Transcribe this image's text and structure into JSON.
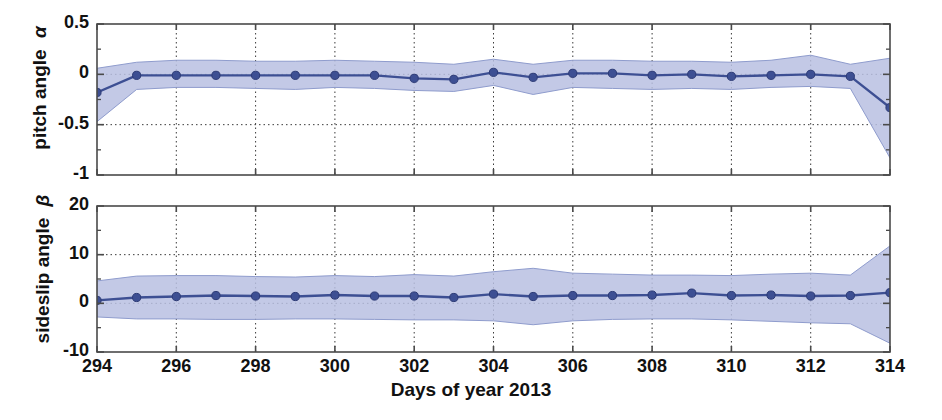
{
  "chart_data": [
    {
      "type": "line",
      "panel": "top",
      "title": "",
      "xlabel": "",
      "ylabel": "pitch angle α",
      "ylabel_text": "pitch angle",
      "ylabel_symbol": "α",
      "xlim": [
        294,
        314
      ],
      "ylim": [
        -1,
        0.5
      ],
      "yticks": [
        0.5,
        0,
        -0.5,
        -1
      ],
      "ytick_labels": [
        "0.5",
        "0",
        "-0.5",
        "-1"
      ],
      "yminorticks": [
        0.25,
        -0.25,
        -0.75
      ],
      "xticks": [
        294,
        296,
        298,
        300,
        302,
        304,
        306,
        308,
        310,
        312,
        314
      ],
      "grid": "dotted",
      "legend": "none",
      "series": [
        {
          "name": "mean pitch angle",
          "marker": "circle",
          "color": "#3d4f93",
          "x": [
            294,
            295,
            296,
            297,
            298,
            299,
            300,
            301,
            302,
            303,
            304,
            305,
            306,
            307,
            308,
            309,
            310,
            311,
            312,
            313,
            314
          ],
          "values": [
            -0.18,
            -0.01,
            -0.01,
            -0.01,
            -0.01,
            -0.01,
            -0.01,
            -0.01,
            -0.04,
            -0.05,
            0.02,
            -0.03,
            0.01,
            0.01,
            -0.01,
            0.0,
            -0.02,
            -0.01,
            0.0,
            -0.02,
            -0.33
          ]
        }
      ],
      "band": {
        "name": "uncertainty band",
        "color": "#b9c0e2",
        "x": [
          294,
          295,
          296,
          297,
          298,
          299,
          300,
          301,
          302,
          303,
          304,
          305,
          306,
          307,
          308,
          309,
          310,
          311,
          312,
          313,
          314
        ],
        "upper": [
          0.06,
          0.12,
          0.14,
          0.14,
          0.13,
          0.13,
          0.14,
          0.13,
          0.12,
          0.1,
          0.15,
          0.1,
          0.14,
          0.14,
          0.13,
          0.13,
          0.12,
          0.14,
          0.19,
          0.1,
          0.16
        ],
        "lower": [
          -0.47,
          -0.15,
          -0.13,
          -0.13,
          -0.14,
          -0.15,
          -0.13,
          -0.14,
          -0.16,
          -0.17,
          -0.11,
          -0.2,
          -0.13,
          -0.14,
          -0.15,
          -0.14,
          -0.15,
          -0.13,
          -0.12,
          -0.14,
          -0.83
        ]
      }
    },
    {
      "type": "line",
      "panel": "bottom",
      "title": "",
      "xlabel": "Days of year 2013",
      "ylabel": "sideslip angle β",
      "ylabel_text": "sideslip angle",
      "ylabel_symbol": "β",
      "xlim": [
        294,
        314
      ],
      "ylim": [
        -10,
        20
      ],
      "yticks": [
        20,
        10,
        0,
        -10
      ],
      "ytick_labels": [
        "20",
        "10",
        "0",
        "-10"
      ],
      "yminorticks": [
        15,
        5,
        -5
      ],
      "xticks": [
        294,
        296,
        298,
        300,
        302,
        304,
        306,
        308,
        310,
        312,
        314
      ],
      "grid": "dotted",
      "legend": "none",
      "series": [
        {
          "name": "mean sideslip angle",
          "marker": "circle",
          "color": "#3d4f93",
          "x": [
            294,
            295,
            296,
            297,
            298,
            299,
            300,
            301,
            302,
            303,
            304,
            305,
            306,
            307,
            308,
            309,
            310,
            311,
            312,
            313,
            314
          ],
          "values": [
            0.6,
            1.2,
            1.4,
            1.6,
            1.5,
            1.4,
            1.7,
            1.5,
            1.5,
            1.2,
            1.9,
            1.4,
            1.6,
            1.6,
            1.7,
            2.1,
            1.6,
            1.7,
            1.5,
            1.6,
            2.2
          ]
        }
      ],
      "band": {
        "name": "uncertainty band",
        "color": "#b9c0e2",
        "x": [
          294,
          295,
          296,
          297,
          298,
          299,
          300,
          301,
          302,
          303,
          304,
          305,
          306,
          307,
          308,
          309,
          310,
          311,
          312,
          313,
          314
        ],
        "upper": [
          4.6,
          5.6,
          5.7,
          5.7,
          5.5,
          5.4,
          5.7,
          5.5,
          5.9,
          5.6,
          6.5,
          7.2,
          6.2,
          6.0,
          5.8,
          5.8,
          5.7,
          6.0,
          6.2,
          5.8,
          11.8
        ],
        "lower": [
          -2.8,
          -3.2,
          -3.2,
          -3.3,
          -3.3,
          -3.2,
          -3.2,
          -3.3,
          -3.4,
          -3.4,
          -3.6,
          -4.4,
          -3.6,
          -3.3,
          -3.2,
          -3.2,
          -3.4,
          -3.7,
          -4.0,
          -4.2,
          -8.2
        ]
      }
    }
  ],
  "axes": {
    "top": {
      "ylabel_text": "pitch angle",
      "ylabel_symbol": "α",
      "ytick_labels": [
        "0.5",
        "0",
        "-0.5",
        "-1"
      ]
    },
    "bottom": {
      "ylabel_text": "sideslip angle",
      "ylabel_symbol": "β",
      "ytick_labels": [
        "20",
        "10",
        "0",
        "-10"
      ]
    },
    "xtick_labels": [
      "294",
      "296",
      "298",
      "300",
      "302",
      "304",
      "306",
      "308",
      "310",
      "312",
      "314"
    ],
    "xlabel": "Days of year 2013"
  },
  "colors": {
    "line": "#3d4f93",
    "band": "#b9c0e2",
    "band_edge": "#8f9ccd",
    "axis": "#4a4a4a",
    "grid": "#3a3a3a",
    "text": "#111111",
    "background": "#ffffff"
  }
}
